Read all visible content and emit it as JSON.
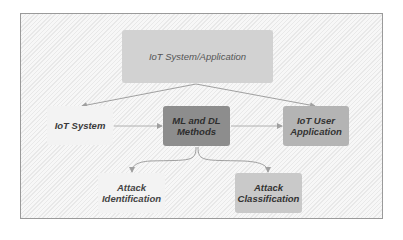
{
  "diagram": {
    "type": "flow",
    "nodes": [
      {
        "id": "top",
        "label": "IoT System/Application",
        "fill": "#d2d2d2"
      },
      {
        "id": "iot",
        "label": "IoT System",
        "fill": "#f3f3f3"
      },
      {
        "id": "ml",
        "label_line1": "ML and DL",
        "label_line2": "Methods",
        "fill": "#8d8d8d"
      },
      {
        "id": "app",
        "label_line1": "IoT User",
        "label_line2": "Application",
        "fill": "#b4b4b4"
      },
      {
        "id": "aid",
        "label_line1": "Attack",
        "label_line2": "Identification",
        "fill": "#f3f3f3"
      },
      {
        "id": "acl",
        "label_line1": "Attack",
        "label_line2": "Classification",
        "fill": "#c9c9c9"
      }
    ],
    "edges": [
      {
        "from": "top",
        "to": "iot"
      },
      {
        "from": "top",
        "to": "app"
      },
      {
        "from": "iot",
        "to": "ml"
      },
      {
        "from": "ml",
        "to": "app"
      },
      {
        "from": "ml",
        "to": "aid"
      },
      {
        "from": "ml",
        "to": "acl"
      }
    ],
    "colors": {
      "edge": "#a0a0a0",
      "frame_border": "#9a9a9a"
    }
  }
}
